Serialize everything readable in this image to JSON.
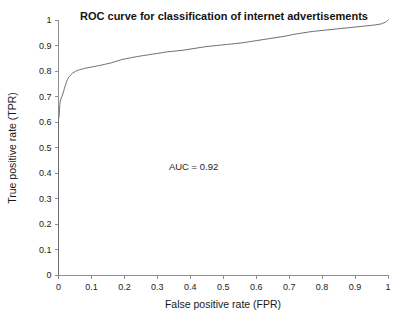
{
  "chart_data": {
    "type": "line",
    "title": "ROC curve for classification of internet advertisements",
    "xlabel": "False positive rate (FPR)",
    "ylabel": "True positive rate (TPR)",
    "xlim": [
      0,
      1
    ],
    "ylim": [
      0,
      1
    ],
    "grid": false,
    "legend": null,
    "annotations": [
      {
        "name": "auc-annotation",
        "text": "AUC = 0.92",
        "x": 0.41,
        "y": 0.41
      }
    ],
    "xticks": [
      0,
      0.1,
      0.2,
      0.3,
      0.4,
      0.5,
      0.6,
      0.7,
      0.8,
      0.9,
      1
    ],
    "xtick_labels": [
      "0",
      "0.1",
      "0.2",
      "0.3",
      "0.4",
      "0.5",
      "0.6",
      "0.7",
      "0.8",
      "0.9",
      "1"
    ],
    "yticks": [
      0,
      0.1,
      0.2,
      0.3,
      0.4,
      0.5,
      0.6,
      0.7,
      0.8,
      0.9,
      1
    ],
    "ytick_labels": [
      "0",
      "0.1",
      "0.2",
      "0.3",
      "0.4",
      "0.5",
      "0.6",
      "0.7",
      "0.8",
      "0.9",
      "1"
    ],
    "line_color": "#6e6e70",
    "series": [
      {
        "name": "ROC curve",
        "x": [
          0.0,
          0.0,
          0.0,
          0.0,
          0.002,
          0.003,
          0.004,
          0.005,
          0.006,
          0.008,
          0.01,
          0.012,
          0.014,
          0.016,
          0.018,
          0.021,
          0.024,
          0.027,
          0.03,
          0.034,
          0.038,
          0.042,
          0.047,
          0.052,
          0.058,
          0.064,
          0.07,
          0.076,
          0.082,
          0.09,
          0.098,
          0.106,
          0.114,
          0.122,
          0.13,
          0.14,
          0.15,
          0.16,
          0.17,
          0.18,
          0.192,
          0.204,
          0.216,
          0.228,
          0.24,
          0.255,
          0.27,
          0.285,
          0.3,
          0.315,
          0.33,
          0.345,
          0.36,
          0.375,
          0.39,
          0.405,
          0.42,
          0.435,
          0.45,
          0.465,
          0.48,
          0.495,
          0.51,
          0.525,
          0.54,
          0.555,
          0.57,
          0.585,
          0.6,
          0.615,
          0.63,
          0.645,
          0.66,
          0.675,
          0.69,
          0.7,
          0.712,
          0.725,
          0.74,
          0.755,
          0.77,
          0.785,
          0.8,
          0.815,
          0.83,
          0.845,
          0.86,
          0.875,
          0.89,
          0.905,
          0.92,
          0.935,
          0.95,
          0.962,
          0.972,
          0.98,
          0.986,
          0.992,
          0.996,
          1.0
        ],
        "y": [
          0.0,
          0.2,
          0.4,
          0.61,
          0.625,
          0.65,
          0.668,
          0.678,
          0.686,
          0.692,
          0.7,
          0.706,
          0.714,
          0.722,
          0.732,
          0.744,
          0.756,
          0.766,
          0.774,
          0.78,
          0.786,
          0.791,
          0.795,
          0.799,
          0.802,
          0.805,
          0.807,
          0.809,
          0.811,
          0.813,
          0.815,
          0.817,
          0.819,
          0.821,
          0.823,
          0.826,
          0.829,
          0.832,
          0.836,
          0.84,
          0.845,
          0.848,
          0.851,
          0.854,
          0.857,
          0.86,
          0.863,
          0.866,
          0.869,
          0.872,
          0.875,
          0.877,
          0.879,
          0.881,
          0.884,
          0.887,
          0.89,
          0.893,
          0.896,
          0.898,
          0.9,
          0.902,
          0.904,
          0.906,
          0.908,
          0.91,
          0.913,
          0.916,
          0.919,
          0.922,
          0.925,
          0.928,
          0.931,
          0.934,
          0.937,
          0.94,
          0.943,
          0.946,
          0.949,
          0.952,
          0.955,
          0.957,
          0.959,
          0.961,
          0.963,
          0.965,
          0.967,
          0.969,
          0.971,
          0.973,
          0.975,
          0.977,
          0.979,
          0.981,
          0.983,
          0.985,
          0.988,
          0.991,
          0.995,
          1.0
        ]
      }
    ]
  }
}
